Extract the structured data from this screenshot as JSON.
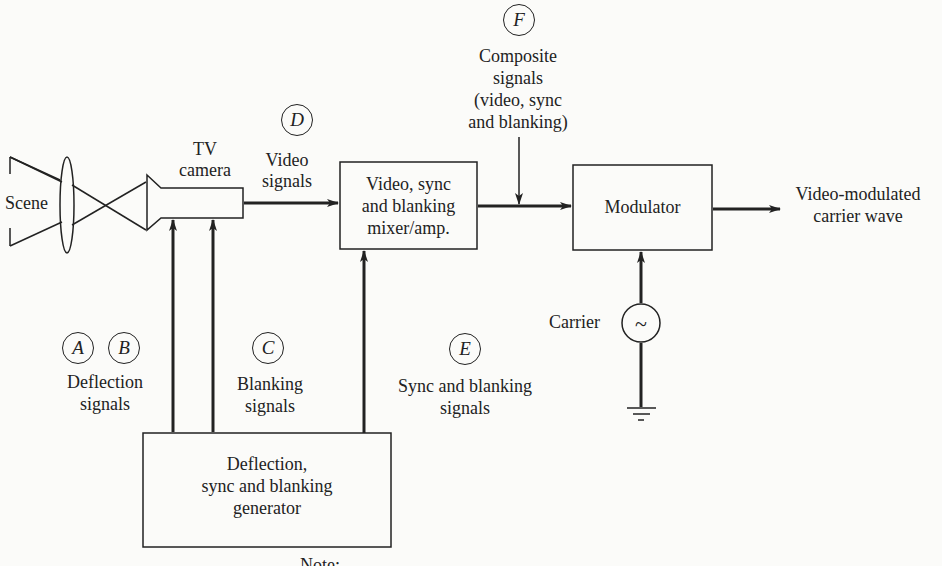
{
  "diagram": {
    "blocks": {
      "scene": "Scene",
      "camera": [
        "TV",
        "camera"
      ],
      "mixer": [
        "Video, sync",
        "and blanking",
        "mixer/amp."
      ],
      "modulator": "Modulator",
      "generator": [
        "Deflection,",
        "sync and blanking",
        "generator"
      ]
    },
    "signals": {
      "A": "A",
      "B": "B",
      "C": "C",
      "D": "D",
      "E": "E",
      "F": "F",
      "deflection": [
        "Deflection",
        "signals"
      ],
      "blanking": [
        "Blanking",
        "signals"
      ],
      "video": [
        "Video",
        "signals"
      ],
      "sync_blanking": [
        "Sync and blanking",
        "signals"
      ],
      "composite": [
        "Composite",
        "signals",
        "(video, sync",
        "and blanking)"
      ],
      "output": [
        "Video-modulated",
        "carrier wave"
      ],
      "carrier": "Carrier",
      "carrier_symbol": "~"
    },
    "footnote": "Note: ..."
  }
}
